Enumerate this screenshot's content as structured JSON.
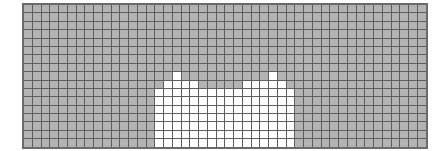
{
  "grid": {
    "cols": 46,
    "rows": 17,
    "cell_width": 7.75,
    "cell_height": 7.4,
    "colors": {
      "filled": "#b3b3b3",
      "empty": "#ffffff",
      "line": "#5e5e5e",
      "border": "#6a6a6a"
    },
    "white_region": {
      "start_col": 15,
      "top_rows": [
        10,
        9,
        8,
        9,
        9,
        10,
        10,
        10,
        10,
        10,
        9,
        9,
        9,
        8,
        9,
        10
      ]
    }
  }
}
